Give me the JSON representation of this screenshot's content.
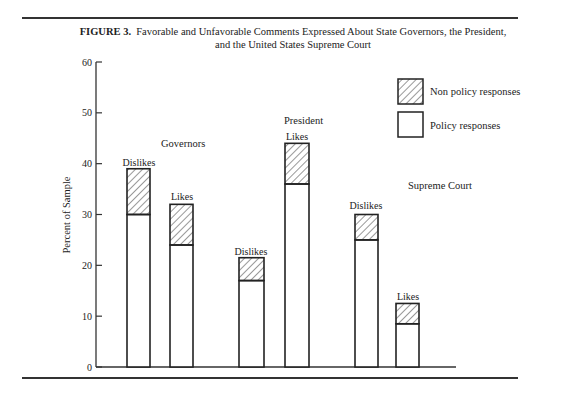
{
  "figure": {
    "label": "FIGURE 3.",
    "title_line1": "Favorable and Unfavorable Comments Expressed About State Governors, the President,",
    "title_line2": "and the United States Supreme Court"
  },
  "legend": {
    "non_policy": "Non policy responses",
    "policy": "Policy responses"
  },
  "groups": {
    "governors": "Governors",
    "president": "President",
    "supreme_court": "Supreme Court"
  },
  "bar_labels": {
    "gov_dislikes": "Dislikes",
    "gov_likes": "Likes",
    "pres_dislikes": "Dislikes",
    "pres_likes": "Likes",
    "sc_dislikes": "Dislikes",
    "sc_likes": "Likes"
  },
  "axis": {
    "ylabel": "Percent of Sample",
    "ticks": [
      "0",
      "10",
      "20",
      "30",
      "40",
      "50",
      "60"
    ]
  },
  "chart_data": {
    "type": "bar",
    "stacked": true,
    "xlabel": "",
    "ylabel": "Percent of Sample",
    "ylim": [
      0,
      60
    ],
    "yticks": [
      0,
      10,
      20,
      30,
      40,
      50,
      60
    ],
    "grid": false,
    "legend_position": "upper right",
    "categories": [
      "Governors - Dislikes",
      "Governors - Likes",
      "President - Dislikes",
      "President - Likes",
      "Supreme Court - Dislikes",
      "Supreme Court - Likes"
    ],
    "groups": [
      {
        "name": "Governors",
        "bars": [
          "Dislikes",
          "Likes"
        ]
      },
      {
        "name": "President",
        "bars": [
          "Dislikes",
          "Likes"
        ]
      },
      {
        "name": "Supreme Court",
        "bars": [
          "Dislikes",
          "Likes"
        ]
      }
    ],
    "series": [
      {
        "name": "Policy responses",
        "pattern": "blank",
        "values": [
          30,
          24,
          17,
          36,
          25,
          8.5
        ]
      },
      {
        "name": "Non policy responses",
        "pattern": "hatched",
        "values": [
          9,
          8,
          4.5,
          8,
          5,
          4
        ]
      }
    ],
    "totals": [
      39,
      32,
      21.5,
      44,
      30,
      12.5
    ]
  }
}
